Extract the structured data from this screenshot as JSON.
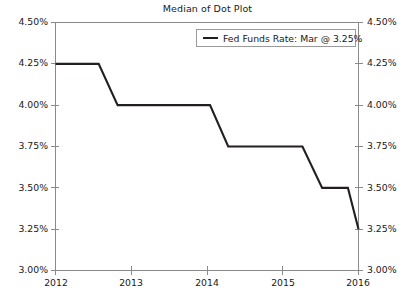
{
  "chart_data": {
    "type": "line",
    "title": "Median of Dot Plot",
    "xlabel": "",
    "ylabel": "",
    "grid": false,
    "legend_position": "top-right",
    "ylim": [
      3.0,
      4.5
    ],
    "xlim": [
      2012,
      2016
    ],
    "y_ticks": [
      "3.00%",
      "3.25%",
      "3.50%",
      "3.75%",
      "4.00%",
      "4.25%",
      "4.50%"
    ],
    "y_tick_values": [
      3.0,
      3.25,
      3.5,
      3.75,
      4.0,
      4.25,
      4.5
    ],
    "x_ticks": [
      "2012",
      "2013",
      "2014",
      "2015",
      "2016"
    ],
    "x_tick_values": [
      2012,
      2013,
      2014,
      2015,
      2016
    ],
    "dual_axis": true,
    "series": [
      {
        "name": "Fed Funds Rate: Mar @ 3.25%",
        "color": "#231f20",
        "step_style": "linear-steps",
        "x": [
          2012.0,
          2012.57,
          2012.82,
          2014.04,
          2014.28,
          2015.26,
          2015.52,
          2015.86,
          2016.0
        ],
        "values": [
          4.25,
          4.25,
          4.0,
          4.0,
          3.75,
          3.75,
          3.5,
          3.5,
          3.25
        ]
      }
    ]
  },
  "legend": {
    "entries": [
      {
        "label": "Fed Funds Rate: Mar @ 3.25%",
        "color": "#231f20"
      }
    ]
  },
  "axes": {
    "left_labels": [
      "4.50%",
      "4.25%",
      "4.00%",
      "3.75%",
      "3.50%",
      "3.25%",
      "3.00%"
    ],
    "right_labels": [
      "4.50%",
      "4.25%",
      "4.00%",
      "3.75%",
      "3.50%",
      "3.25%",
      "3.00%"
    ],
    "bottom_labels": [
      "2012",
      "2013",
      "2014",
      "2015",
      "2016"
    ]
  },
  "colors": {
    "series": "#231f20",
    "axis": "#8a8a8a",
    "background": "#ffffff",
    "text": "#1a1a1a"
  }
}
